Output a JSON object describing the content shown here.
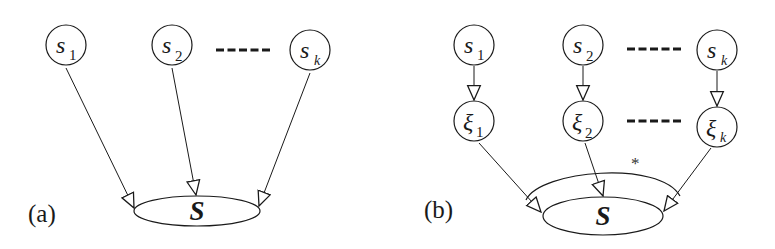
{
  "figure": {
    "panel_a": {
      "label": "(a)",
      "sources": [
        {
          "name": "s",
          "sub": "1"
        },
        {
          "name": "s",
          "sub": "2"
        },
        {
          "name": "s",
          "sub": "k"
        }
      ],
      "ellipsis": "-----",
      "target": "S"
    },
    "panel_b": {
      "label": "(b)",
      "sources": [
        {
          "name": "s",
          "sub": "1"
        },
        {
          "name": "s",
          "sub": "2"
        },
        {
          "name": "s",
          "sub": "k"
        }
      ],
      "noise_nodes": [
        {
          "name": "ξ",
          "sub": "1"
        },
        {
          "name": "ξ",
          "sub": "2"
        },
        {
          "name": "ξ",
          "sub": "k"
        }
      ],
      "ellipsis": "-----",
      "target": "S",
      "arc_marker": "*"
    },
    "colors": {
      "stroke": "#1a1a1a",
      "background": "#ffffff"
    }
  }
}
